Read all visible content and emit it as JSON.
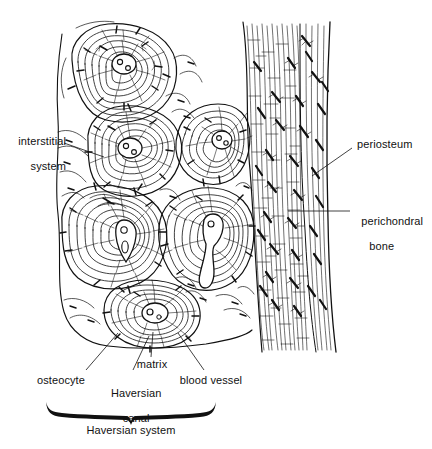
{
  "figure": {
    "ink_color": "#111111",
    "background_color": "#ffffff"
  },
  "labels": {
    "interstitial_system": "interstitial\nsystem",
    "interstitial_system_line1": "interstitial",
    "interstitial_system_line2": "system",
    "periosteum": "periosteum",
    "perichondral_bone_line1": "perichondral",
    "perichondral_bone_line2": "bone",
    "osteocyte": "osteocyte",
    "haversian_canal_line1": "Haversian",
    "haversian_canal_line2": "canal",
    "matrix": "matrix",
    "blood_vessel": "blood vessel",
    "haversian_system": "Haversian system"
  },
  "structures": {
    "osteons": [
      {
        "name": "osteon-top-left",
        "cx": 120,
        "cy": 72,
        "rx": 54,
        "ry": 50,
        "rot": -8,
        "canal_cx": 124,
        "canal_cy": 62,
        "rings": 7
      },
      {
        "name": "osteon-upper-mid",
        "cx": 133,
        "cy": 155,
        "rx": 49,
        "ry": 46,
        "rot": 10,
        "canal_cx": 128,
        "canal_cy": 146,
        "rings": 7
      },
      {
        "name": "osteon-upper-right",
        "cx": 212,
        "cy": 142,
        "rx": 38,
        "ry": 40,
        "rot": -4,
        "canal_cx": 222,
        "canal_cy": 130,
        "rings": 6
      },
      {
        "name": "osteon-left-mid",
        "cx": 113,
        "cy": 238,
        "rx": 53,
        "ry": 52,
        "rot": 4,
        "canal_cx": 120,
        "canal_cy": 232,
        "rings": 7
      },
      {
        "name": "osteon-right-mid",
        "cx": 206,
        "cy": 230,
        "rx": 48,
        "ry": 50,
        "rot": -6,
        "canal_cx": 207,
        "canal_cy": 222,
        "rings": 7
      },
      {
        "name": "osteon-bottom",
        "cx": 152,
        "cy": 318,
        "rx": 48,
        "ry": 38,
        "rot": 2,
        "canal_cx": 153,
        "canal_cy": 316,
        "rings": 6
      }
    ],
    "periosteum_band": {
      "x_start": 243,
      "x_end": 332,
      "y_top": 22,
      "y_bottom": 352
    },
    "perichondral_cell_count": 34
  },
  "leaders": {
    "interstitial": {
      "from_x": 64,
      "from_y": 143,
      "to_x": 104,
      "to_y": 157
    },
    "periosteum": {
      "from_x": 352,
      "from_y": 148,
      "to_x": 312,
      "to_y": 175
    },
    "perichondral": {
      "from_x": 350,
      "from_y": 211,
      "to_x": 288,
      "to_y": 211
    },
    "osteocyte": {
      "from_x": 86,
      "from_y": 370,
      "to_x": 118,
      "to_y": 333
    },
    "haversian_canal": {
      "from_x": 133,
      "from_y": 370,
      "to_x": 148,
      "to_y": 336
    },
    "matrix": {
      "from_x": 151,
      "from_y": 357,
      "to_x": 152,
      "to_y": 333
    },
    "blood_vessel": {
      "from_x": 204,
      "from_y": 370,
      "to_x": 178,
      "to_y": 333
    }
  },
  "brace": {
    "x_left": 46,
    "x_right": 216,
    "y": 406,
    "tip_x": 131,
    "tip_y": 419
  }
}
